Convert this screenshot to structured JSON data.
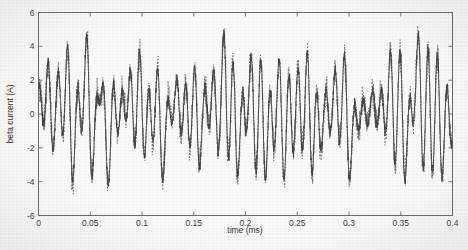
{
  "chart_data": {
    "type": "line",
    "title": "",
    "xlabel": "time (ms)",
    "ylabel": "beta current (A)",
    "xlim": [
      0,
      0.4
    ],
    "ylim": [
      -6,
      6
    ],
    "xticks": [
      0,
      0.05,
      0.1,
      0.15,
      0.2,
      0.25,
      0.3,
      0.35,
      0.4
    ],
    "xticklabels": [
      "0",
      "0.05",
      "0.1",
      "0.15",
      "0.2",
      "0.25",
      "0.3",
      "0.35",
      "0.4"
    ],
    "yticks": [
      -6,
      -4,
      -2,
      0,
      2,
      4,
      6
    ],
    "yticklabels": [
      "-6",
      "-4",
      "-2",
      "0",
      "2",
      "4",
      "6"
    ],
    "grid": false,
    "legend": null,
    "box": true,
    "tick_direction": "in",
    "series": [
      {
        "name": "solid-trace",
        "style": "solid",
        "color": "#4a4a4a",
        "description": "Oscillatory beta current: narrow bipolar spikes riding on a near-zero baseline",
        "peak_times": [
          0.0035,
          0.0115,
          0.0215,
          0.0305,
          0.04,
          0.049,
          0.0585,
          0.065,
          0.0745,
          0.083,
          0.091,
          0.1,
          0.1085,
          0.1175,
          0.127,
          0.136,
          0.1445,
          0.153,
          0.163,
          0.1715,
          0.1815,
          0.19,
          0.199,
          0.208,
          0.217,
          0.2255,
          0.235,
          0.244,
          0.253,
          0.262,
          0.2705,
          0.28,
          0.289,
          0.298,
          0.307,
          0.316,
          0.325,
          0.3335,
          0.3425,
          0.3515,
          0.3605,
          0.3695,
          0.3785,
          0.3875,
          0.3965
        ],
        "peak_values": [
          2.1,
          4.2,
          3.1,
          5.6,
          2.3,
          5.8,
          1.6,
          3.9,
          2.6,
          2.1,
          3.6,
          5.0,
          2.9,
          4.1,
          1.2,
          2.5,
          3.0,
          4.4,
          2.0,
          3.5,
          5.9,
          5.2,
          2.2,
          4.6,
          5.0,
          3.1,
          4.6,
          3.6,
          3.8,
          5.2,
          2.9,
          2.0,
          3.3,
          5.0,
          1.4,
          1.3,
          1.7,
          2.1,
          5.0,
          5.6,
          1.6,
          5.8,
          5.7,
          5.5,
          2.6
        ],
        "trough_values": [
          -2.2,
          -3.2,
          -2.4,
          -5.1,
          -2.1,
          -5.2,
          -1.5,
          -5.1,
          -2.0,
          -1.9,
          -3.3,
          -4.1,
          -2.5,
          -4.9,
          -1.2,
          -2.3,
          -3.2,
          -4.0,
          -2.0,
          -3.3,
          -4.8,
          -4.9,
          -2.1,
          -5.2,
          -5.5,
          -2.8,
          -5.3,
          -3.7,
          -3.6,
          -5.0,
          -2.8,
          -2.0,
          -3.1,
          -5.0,
          -1.3,
          -1.2,
          -1.6,
          -2.0,
          -4.6,
          -5.2,
          -1.5,
          -5.3,
          -5.3,
          -5.1,
          -2.4
        ]
      },
      {
        "name": "dashed-trace",
        "style": "dashed",
        "color": "#6e6e6e",
        "description": "Second overlapping trace tracking the solid curve with extra high-frequency noise around the zero baseline",
        "baseline_noise_amplitude": 0.75
      }
    ]
  },
  "figure": {
    "axis_color": "#6a6a6a",
    "background": "#fbfaf8",
    "text_color": "#333333"
  }
}
